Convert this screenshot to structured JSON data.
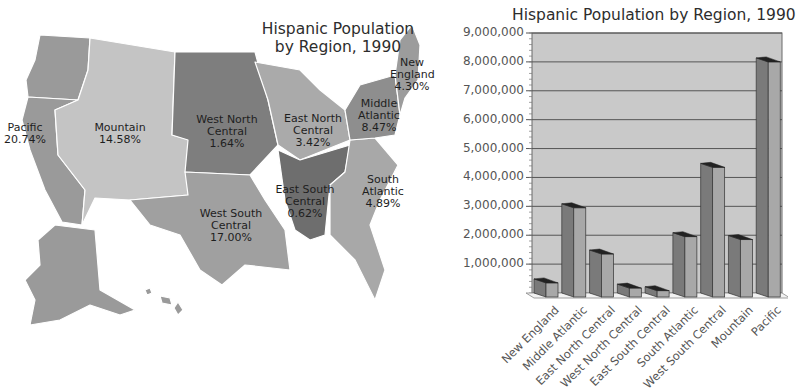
{
  "map": {
    "title_line1": "Hispanic Population",
    "title_line2": "by Region, 1990",
    "regions": [
      {
        "name_line1": "Pacific",
        "name_line2": "",
        "percent": "20.74%",
        "color": "#9a9a9a"
      },
      {
        "name_line1": "Mountain",
        "name_line2": "",
        "percent": "14.58%",
        "color": "#c4c4c4"
      },
      {
        "name_line1": "West North",
        "name_line2": "Central",
        "percent": "1.64%",
        "color": "#7e7e7e"
      },
      {
        "name_line1": "East North",
        "name_line2": "Central",
        "percent": "3.42%",
        "color": "#aaaaaa"
      },
      {
        "name_line1": "Middle",
        "name_line2": "Atlantic",
        "percent": "8.47%",
        "color": "#8e8e8e"
      },
      {
        "name_line1": "New",
        "name_line2": "England",
        "percent": "4.30%",
        "color": "#9c9c9c"
      },
      {
        "name_line1": "South",
        "name_line2": "Atlantic",
        "percent": "4.89%",
        "color": "#a8a8a8"
      },
      {
        "name_line1": "East South",
        "name_line2": "Central",
        "percent": "0.62%",
        "color": "#6e6e6e"
      },
      {
        "name_line1": "West South",
        "name_line2": "Central",
        "percent": "17.00%",
        "color": "#a0a0a0"
      }
    ]
  },
  "chart_data": {
    "type": "bar",
    "title": "Hispanic Population by Region, 1990",
    "xlabel": "",
    "ylabel": "",
    "ylim": [
      0,
      9000000
    ],
    "grid": true,
    "style": "3d",
    "y_ticks": [
      "1,000,000",
      "2,000,000",
      "3,000,000",
      "4,000,000",
      "5,000,000",
      "6,000,000",
      "7,000,000",
      "8,000,000",
      "9,000,000"
    ],
    "categories": [
      "New England",
      "Middle Atlantic",
      "East North Central",
      "West North Central",
      "East South Central",
      "South Atlantic",
      "West South Central",
      "Mountain",
      "Pacific"
    ],
    "values": [
      350000,
      2950000,
      1350000,
      170000,
      80000,
      1950000,
      4350000,
      1850000,
      8000000
    ]
  }
}
